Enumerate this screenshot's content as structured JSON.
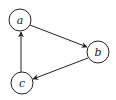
{
  "diagram": {
    "type": "directed-graph",
    "nodes": [
      {
        "id": "a",
        "label": "a",
        "cx": 20,
        "cy": 20,
        "r": 11
      },
      {
        "id": "b",
        "label": "b",
        "cx": 98,
        "cy": 52,
        "r": 11
      },
      {
        "id": "c",
        "label": "c",
        "cx": 22,
        "cy": 83,
        "r": 11
      }
    ],
    "edges": [
      {
        "from": "a",
        "to": "b"
      },
      {
        "from": "b",
        "to": "c"
      },
      {
        "from": "c",
        "to": "a"
      }
    ],
    "colors": {
      "stroke": "#222222",
      "background": "#ffffff"
    }
  }
}
